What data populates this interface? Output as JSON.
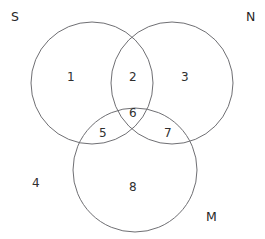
{
  "diagram": {
    "type": "venn-3-set",
    "title": "",
    "stroke_color": "#6f6f73",
    "text_color": "#2b2b2b",
    "background_color": "#ffffff",
    "set_labels": [
      {
        "id": "S",
        "text": "S",
        "position": "top-left",
        "x": 11,
        "y": 11
      },
      {
        "id": "N",
        "text": "N",
        "position": "top-right",
        "x": 246,
        "y": 11
      },
      {
        "id": "M",
        "text": "M",
        "position": "bottom-right",
        "x": 206,
        "y": 211
      }
    ],
    "circles": [
      {
        "id": "S",
        "cx": 92,
        "cy": 83,
        "r": 61
      },
      {
        "id": "N",
        "cx": 172,
        "cy": 83,
        "r": 61
      },
      {
        "id": "M",
        "cx": 135,
        "cy": 170,
        "r": 62
      }
    ],
    "regions": [
      {
        "id": "region-1",
        "text": "1",
        "meaning": "S only",
        "x": 67,
        "y": 71
      },
      {
        "id": "region-2",
        "text": "2",
        "meaning": "S and N only",
        "x": 129,
        "y": 71
      },
      {
        "id": "region-3",
        "text": "3",
        "meaning": "N only",
        "x": 181,
        "y": 71
      },
      {
        "id": "region-4",
        "text": "4",
        "meaning": "outside all sets",
        "x": 32,
        "y": 177
      },
      {
        "id": "region-5",
        "text": "5",
        "meaning": "S and M only",
        "x": 99,
        "y": 127
      },
      {
        "id": "region-6",
        "text": "6",
        "meaning": "S and N and M",
        "x": 129,
        "y": 107
      },
      {
        "id": "region-7",
        "text": "7",
        "meaning": "N and M only",
        "x": 164,
        "y": 127
      },
      {
        "id": "region-8",
        "text": "8",
        "meaning": "M only",
        "x": 129,
        "y": 181
      }
    ]
  }
}
